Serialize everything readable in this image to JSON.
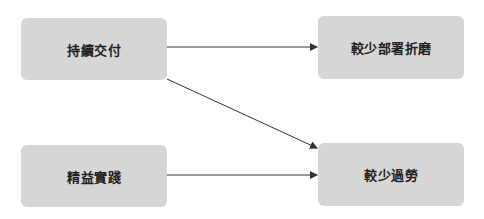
{
  "diagram": {
    "type": "flow",
    "colors": {
      "node_fill": "#d6d6d6",
      "node_text": "#222222",
      "edge": "#333333",
      "background": "#ffffff"
    },
    "nodes": [
      {
        "id": "n1",
        "label": "持續交付"
      },
      {
        "id": "n2",
        "label": "較少部署折磨"
      },
      {
        "id": "n3",
        "label": "精益實踐"
      },
      {
        "id": "n4",
        "label": "較少過勞"
      }
    ],
    "edges": [
      {
        "from": "n1",
        "to": "n2"
      },
      {
        "from": "n1",
        "to": "n4"
      },
      {
        "from": "n3",
        "to": "n4"
      }
    ]
  }
}
